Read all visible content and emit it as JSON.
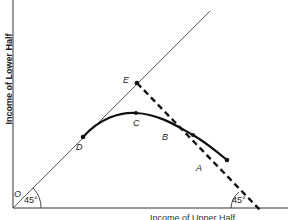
{
  "diagram": {
    "y_axis_label": "Income of Lower Half",
    "x_axis_label": "Income of Upper Half",
    "origin_label": "O",
    "points": [
      {
        "label": "E",
        "x": 137,
        "y": 83
      },
      {
        "label": "D",
        "x": 83,
        "y": 137
      },
      {
        "label": "C",
        "x": 136,
        "y": 143
      },
      {
        "label": "B",
        "x": 193,
        "y": 155
      },
      {
        "label": "A",
        "x": 227,
        "y": 179
      }
    ],
    "angles": {
      "origin": "45°",
      "right": "45°"
    },
    "lines": {
      "equality_line": "45° line from O",
      "dashed_line": "from E to x-axis at 45°",
      "curve": "D–C–B–A utility possibility frontier"
    },
    "colors": {
      "ink": "#222222",
      "background": "#ffffff"
    }
  }
}
